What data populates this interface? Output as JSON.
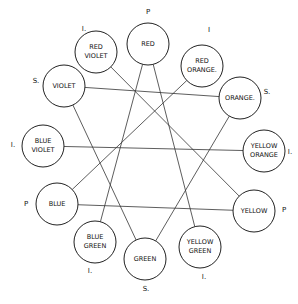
{
  "diagram": {
    "type": "color-wheel-hexagram",
    "colors": [
      {
        "id": "red",
        "lines": [
          "RED"
        ],
        "class_mark": "P"
      },
      {
        "id": "red-orange",
        "lines": [
          "RED",
          "ORANGE."
        ],
        "class_mark": "I"
      },
      {
        "id": "orange",
        "lines": [
          "ORANGE."
        ],
        "class_mark": "S."
      },
      {
        "id": "yellow-orange",
        "lines": [
          "YELLOW",
          "ORANGE"
        ],
        "class_mark": "I."
      },
      {
        "id": "yellow",
        "lines": [
          "YELLOW"
        ],
        "class_mark": "P"
      },
      {
        "id": "yellow-green",
        "lines": [
          "YELLOW",
          "GREEN"
        ],
        "class_mark": "I."
      },
      {
        "id": "green",
        "lines": [
          "GREEN"
        ],
        "class_mark": "S."
      },
      {
        "id": "blue-green",
        "lines": [
          "BLUE",
          "GREEN"
        ],
        "class_mark": "I."
      },
      {
        "id": "blue",
        "lines": [
          "BLUE"
        ],
        "class_mark": "P"
      },
      {
        "id": "blue-violet",
        "lines": [
          "BLUE",
          "VIOLET"
        ],
        "class_mark": "I."
      },
      {
        "id": "violet",
        "lines": [
          "VIOLET"
        ],
        "class_mark": "S."
      },
      {
        "id": "red-violet",
        "lines": [
          "RED",
          "VIOLET"
        ],
        "class_mark": "I."
      }
    ],
    "connections": [
      [
        "red",
        "blue-green"
      ],
      [
        "red",
        "yellow-green"
      ],
      [
        "red-violet",
        "yellow"
      ],
      [
        "red-orange",
        "blue"
      ],
      [
        "violet",
        "orange"
      ],
      [
        "blue-violet",
        "yellow-orange"
      ],
      [
        "blue",
        "yellow"
      ],
      [
        "green",
        "violet"
      ],
      [
        "green",
        "orange"
      ]
    ],
    "legend": {
      "P": "Primary",
      "S": "Secondary",
      "I": "Intermediate"
    }
  }
}
